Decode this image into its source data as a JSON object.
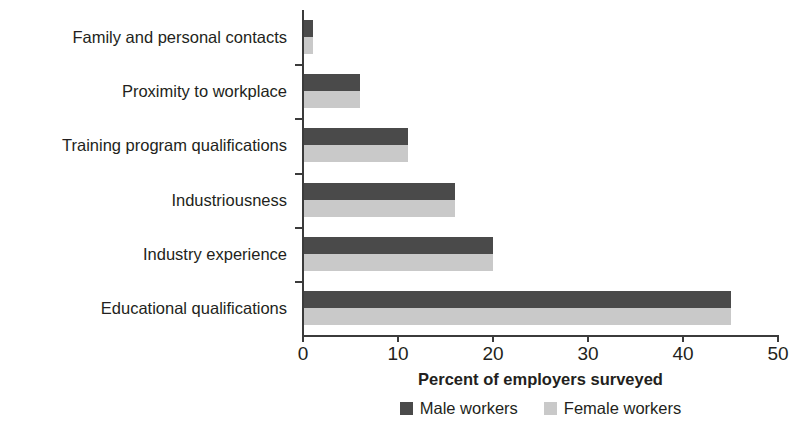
{
  "chart_data": {
    "type": "bar",
    "orientation": "horizontal",
    "title": "",
    "xlabel": "Percent of employers surveyed",
    "ylabel": "",
    "xlim": [
      0,
      50
    ],
    "xticks": [
      0,
      10,
      20,
      30,
      40,
      50
    ],
    "xtick_labels": [
      "0",
      "10",
      "20",
      "30",
      "40",
      "50"
    ],
    "grid": false,
    "legend_position": "bottom",
    "categories": [
      "Family and personal contacts",
      "Proximity to workplace",
      "Training program qualifications",
      "Industriousness",
      "Industry experience",
      "Educational qualifications"
    ],
    "series": [
      {
        "name": "Male workers",
        "color": "#4a4a4a",
        "values": [
          1,
          6,
          11,
          16,
          20,
          45
        ]
      },
      {
        "name": "Female workers",
        "color": "#c9c9c9",
        "values": [
          1,
          6,
          11,
          16,
          20,
          45
        ]
      }
    ]
  },
  "legend": {
    "items": [
      {
        "label": "Male workers",
        "color": "#4a4a4a"
      },
      {
        "label": "Female workers",
        "color": "#c9c9c9"
      }
    ]
  }
}
